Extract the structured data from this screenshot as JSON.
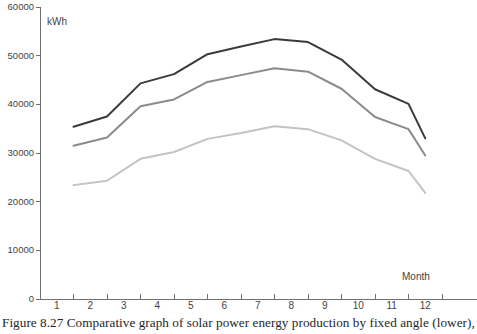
{
  "figure": {
    "caption": "Figure 8.27  Comparative graph of solar power energy production by fixed angle (lower),"
  },
  "chart_data": {
    "type": "line",
    "title": "",
    "subtitle": "",
    "xlabel": "Month",
    "ylabel": "kWh",
    "x": [
      2,
      3,
      4,
      5,
      6,
      7,
      8,
      9,
      10,
      11,
      12,
      12.5
    ],
    "categories": [
      "1",
      "2",
      "3",
      "4",
      "5",
      "6",
      "7",
      "8",
      "9",
      "10",
      "11",
      "12"
    ],
    "xlim": [
      1,
      13
    ],
    "ylim": [
      0,
      60000
    ],
    "ytick_values": [
      0,
      10000,
      20000,
      30000,
      40000,
      50000,
      60000
    ],
    "ytick_labels": [
      "0",
      "10000",
      "20000",
      "30000",
      "40000",
      "50000",
      "60000"
    ],
    "xtick_labels": [
      "1",
      "2",
      "3",
      "4",
      "5",
      "6",
      "7",
      "8",
      "9",
      "10",
      "11",
      "12"
    ],
    "grid": false,
    "legend": "none",
    "series": [
      {
        "name": "upper-curve",
        "color": "#3a3a3a",
        "values": [
          35400,
          37500,
          44300,
          46200,
          50300,
          51900,
          53400,
          52800,
          49200,
          43100,
          40100,
          33000
        ]
      },
      {
        "name": "middle-curve",
        "color": "#8b8b8b",
        "values": [
          31500,
          33200,
          39600,
          41000,
          44600,
          46000,
          47400,
          46700,
          43200,
          37400,
          34900,
          29500
        ]
      },
      {
        "name": "lower-curve",
        "color": "#c3c3c3",
        "values": [
          23400,
          24300,
          28800,
          30200,
          32900,
          34100,
          35500,
          34900,
          32600,
          28800,
          26300,
          21800
        ]
      }
    ],
    "axis_color": "#6f6f6f"
  }
}
